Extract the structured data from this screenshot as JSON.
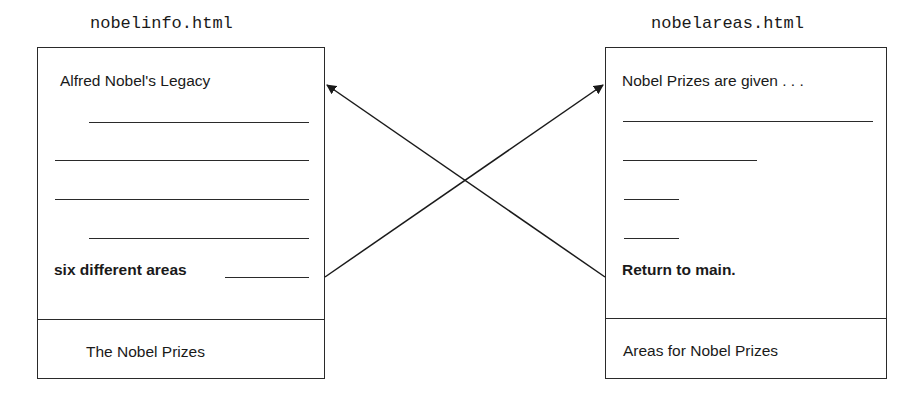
{
  "pages": [
    {
      "filename": "nobelinfo.html",
      "heading": "Alfred Nobel's Legacy",
      "link_text": "six different areas",
      "footer_title": "The Nobel Prizes",
      "placeholder_lines": 5
    },
    {
      "filename": "nobelareas.html",
      "heading": "Nobel Prizes are given . . .",
      "link_text": "Return to main.",
      "footer_title": "Areas for Nobel Prizes",
      "placeholder_lines": 4
    }
  ],
  "links": [
    {
      "from": "nobelinfo.html",
      "anchor": "six different areas",
      "to": "nobelareas.html"
    },
    {
      "from": "nobelareas.html",
      "anchor": "Return to main.",
      "to": "nobelinfo.html"
    }
  ],
  "colors": {
    "stroke": "#2a2a2a",
    "background": "#ffffff"
  }
}
